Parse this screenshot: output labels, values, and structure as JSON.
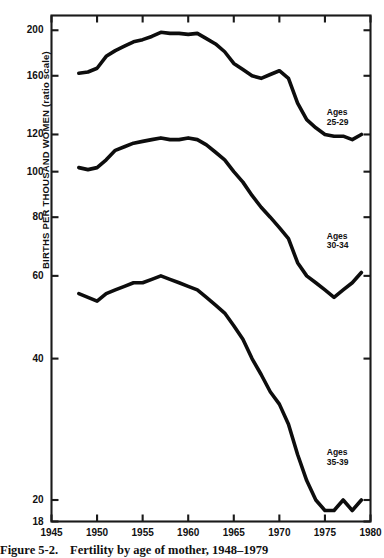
{
  "caption": {
    "number": "Figure 5-2.",
    "text": "Fertility by age of mother, 1948–1979"
  },
  "axes": {
    "ylabel": "BIRTHS PER THOUSAND WOMEN (ratio scale)",
    "xlabel": "",
    "yticks": [
      200,
      160,
      120,
      100,
      80,
      60,
      40,
      20,
      18
    ],
    "ytick_labels": [
      "200",
      "160",
      "120",
      "100",
      "80",
      "60",
      "40",
      "20",
      "18"
    ],
    "xticks": [
      1945,
      1950,
      1955,
      1960,
      1965,
      1970,
      1975,
      1980
    ],
    "xtick_labels": [
      "1945",
      "1950",
      "1955",
      "1960",
      "1965",
      "1970",
      "1975",
      "1980"
    ],
    "yscale": "log",
    "ylim": [
      18,
      215
    ],
    "xlim": [
      1945,
      1980
    ],
    "grid": false,
    "frame": true
  },
  "annotations": [
    {
      "name": "ages-25-29",
      "line1": "Ages",
      "line2": "25-29",
      "x": 1975.2,
      "y": 130
    },
    {
      "name": "ages-30-34",
      "line1": "Ages",
      "line2": "30-34",
      "x": 1975.2,
      "y": 71
    },
    {
      "name": "ages-35-39",
      "line1": "Ages",
      "line2": "35-39",
      "x": 1975.2,
      "y": 24.6
    }
  ],
  "colors": {
    "line": "#0d0d0d",
    "frame": "#1a1a1a",
    "background": "#ffffff",
    "text": "#111111"
  },
  "chart_data": {
    "type": "line",
    "title": "Fertility by age of mother, 1948–1979",
    "xlabel": "",
    "ylabel": "BIRTHS PER THOUSAND WOMEN (ratio scale)",
    "yscale": "log",
    "ylim": [
      18,
      215
    ],
    "xlim": [
      1945,
      1980
    ],
    "grid": false,
    "legend_position": "inline-annotation",
    "x": [
      1948,
      1949,
      1950,
      1951,
      1952,
      1953,
      1954,
      1955,
      1956,
      1957,
      1958,
      1959,
      1960,
      1961,
      1962,
      1963,
      1964,
      1965,
      1966,
      1967,
      1968,
      1969,
      1970,
      1971,
      1972,
      1973,
      1974,
      1975,
      1976,
      1977,
      1978,
      1979
    ],
    "series": [
      {
        "name": "Ages 25-29",
        "values": [
          162,
          163,
          166,
          176,
          181,
          185,
          189,
          191,
          194,
          198,
          197,
          197,
          196,
          197,
          192,
          187,
          180,
          170,
          165,
          160,
          158,
          161,
          164,
          158,
          140,
          129,
          124,
          120,
          119,
          119,
          117,
          120
        ]
      },
      {
        "name": "Ages 30-34",
        "values": [
          102,
          101,
          102,
          106,
          111,
          113,
          115,
          116,
          117,
          118,
          117,
          117,
          118,
          117,
          114,
          110,
          106,
          100,
          95,
          89,
          84,
          80,
          76,
          72,
          64,
          60,
          58,
          56,
          54,
          56,
          58,
          61
        ]
      },
      {
        "name": "Ages 35-39",
        "values": [
          55,
          54,
          53,
          55,
          56,
          57,
          58,
          58,
          59,
          60,
          59,
          58,
          57,
          56,
          54,
          52,
          50,
          47,
          44,
          40,
          37,
          34,
          32,
          29,
          25,
          22,
          20,
          19,
          19,
          20,
          19,
          20
        ]
      }
    ]
  }
}
